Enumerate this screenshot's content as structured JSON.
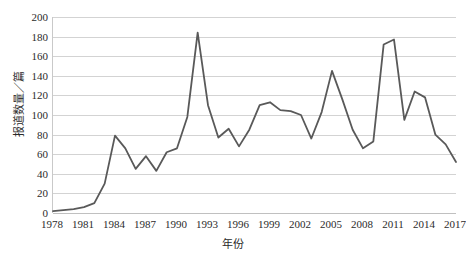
{
  "chart_data": {
    "type": "line",
    "title": "",
    "xlabel": "年份",
    "ylabel": "报道数量／篇",
    "xlim": [
      1978,
      2017
    ],
    "ylim": [
      0,
      200
    ],
    "ytick_step": 20,
    "yticks": [
      200,
      180,
      160,
      140,
      120,
      100,
      80,
      60,
      40,
      20,
      0
    ],
    "xticks": [
      1978,
      1981,
      1984,
      1987,
      1990,
      1993,
      1996,
      1999,
      2002,
      2005,
      2008,
      2011,
      2014,
      2017
    ],
    "grid": "horizontal",
    "legend": "none",
    "line_color": "#595959",
    "gridline_color": "#d3d3d3",
    "series": [
      {
        "name": "报道数量",
        "x": [
          1978,
          1979,
          1980,
          1981,
          1982,
          1983,
          1984,
          1985,
          1986,
          1987,
          1988,
          1989,
          1990,
          1991,
          1992,
          1993,
          1994,
          1995,
          1996,
          1997,
          1998,
          1999,
          2000,
          2001,
          2002,
          2003,
          2004,
          2005,
          2006,
          2007,
          2008,
          2009,
          2010,
          2011,
          2012,
          2013,
          2014,
          2015,
          2016,
          2017
        ],
        "values": [
          2,
          3,
          4,
          6,
          10,
          30,
          79,
          66,
          45,
          58,
          43,
          62,
          66,
          98,
          184,
          110,
          77,
          86,
          68,
          85,
          110,
          113,
          105,
          104,
          100,
          76,
          103,
          145,
          116,
          85,
          66,
          73,
          172,
          177,
          95,
          124,
          118,
          80,
          70,
          52
        ]
      }
    ]
  }
}
